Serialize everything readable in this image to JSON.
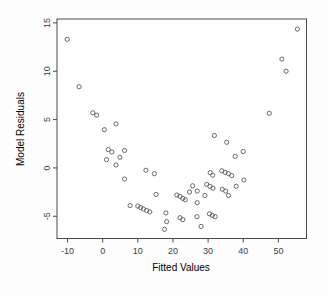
{
  "chart_data": {
    "type": "scatter",
    "title": "",
    "xlabel": "Fitted Values",
    "ylabel": "Model Residuals",
    "xlim": [
      -13,
      58
    ],
    "ylim": [
      -7.3,
      15.4
    ],
    "xticks": [
      -10,
      0,
      10,
      20,
      30,
      40,
      50
    ],
    "yticks": [
      -5,
      0,
      5,
      10,
      15
    ],
    "grid": false,
    "legend": "none",
    "marker": "open-circle",
    "colors": {
      "axis": "#4a4a4a",
      "text": "#3f3f3f",
      "marker": "#5a5a5a",
      "background": "#ffffff"
    },
    "series": [
      {
        "name": "residuals",
        "points": [
          [
            -10.1,
            13.3
          ],
          [
            -6.7,
            8.4
          ],
          [
            -2.8,
            5.7
          ],
          [
            -1.7,
            5.45
          ],
          [
            0.5,
            3.95
          ],
          [
            3.8,
            4.55
          ],
          [
            1.6,
            1.9
          ],
          [
            2.6,
            1.65
          ],
          [
            6.2,
            1.8
          ],
          [
            1.1,
            0.85
          ],
          [
            4.9,
            1.1
          ],
          [
            3.8,
            0.3
          ],
          [
            12.3,
            -0.25
          ],
          [
            14.7,
            -0.6
          ],
          [
            6.2,
            -1.15
          ],
          [
            7.8,
            -3.9
          ],
          [
            10.0,
            -3.95
          ],
          [
            10.8,
            -4.1
          ],
          [
            11.6,
            -4.25
          ],
          [
            12.5,
            -4.4
          ],
          [
            13.4,
            -4.55
          ],
          [
            15.2,
            -2.75
          ],
          [
            18.0,
            -4.65
          ],
          [
            18.2,
            -5.55
          ],
          [
            17.6,
            -6.35
          ],
          [
            21.1,
            -2.8
          ],
          [
            22.0,
            -2.95
          ],
          [
            22.8,
            -3.15
          ],
          [
            23.5,
            -3.3
          ],
          [
            24.7,
            -2.5
          ],
          [
            25.6,
            -1.85
          ],
          [
            26.9,
            -2.4
          ],
          [
            29.1,
            -2.85
          ],
          [
            26.9,
            -3.6
          ],
          [
            22.0,
            -5.15
          ],
          [
            22.8,
            -5.35
          ],
          [
            26.8,
            -5.05
          ],
          [
            28.0,
            -6.05
          ],
          [
            29.6,
            -1.7
          ],
          [
            30.5,
            -1.9
          ],
          [
            31.4,
            -2.1
          ],
          [
            30.4,
            -4.75
          ],
          [
            31.2,
            -4.9
          ],
          [
            32.0,
            -5.05
          ],
          [
            30.6,
            -0.5
          ],
          [
            31.3,
            -0.75
          ],
          [
            33.9,
            -0.3
          ],
          [
            34.8,
            -0.45
          ],
          [
            35.8,
            -0.6
          ],
          [
            36.7,
            -0.8
          ],
          [
            34.0,
            -2.2
          ],
          [
            35.0,
            -2.4
          ],
          [
            35.8,
            -2.85
          ],
          [
            38.0,
            -1.9
          ],
          [
            40.2,
            -1.25
          ],
          [
            31.8,
            3.35
          ],
          [
            35.3,
            2.65
          ],
          [
            40.0,
            1.7
          ],
          [
            37.7,
            1.2
          ],
          [
            47.4,
            5.65
          ],
          [
            51.0,
            11.25
          ],
          [
            52.2,
            10.0
          ],
          [
            55.4,
            14.35
          ]
        ]
      }
    ]
  }
}
